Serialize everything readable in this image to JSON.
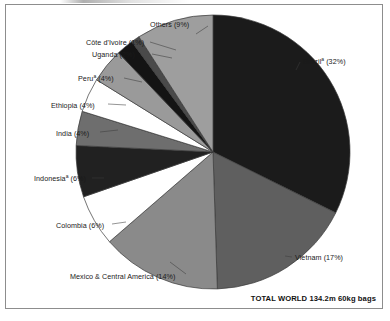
{
  "figure": {
    "frame_border_color": "#8d8d8d",
    "background": "#ffffff",
    "total_note": "TOTAL WORLD 134.2m 60kg bags"
  },
  "labels": {
    "brazil": "Brazil",
    "brazil_pct": " (32%)",
    "brazil_sup": "a",
    "vietnam": "Vietnam (17%)",
    "mexico": "Mexico & Central America (14%)",
    "colombia": "Colombia (6%)",
    "indonesia": "Indonesia",
    "indonesia_pct": " (6%)",
    "indonesia_sup": "a",
    "india": "India (4%)",
    "ethiopia": "Ethiopia (4%)",
    "peru": "Peru",
    "peru_pct": " (4%)",
    "peru_sup": "a",
    "uganda": "Uganda (2%)",
    "cotedivoire": "Côte d'Ivoire (1%)",
    "others": "Others (9%)"
  },
  "chart_data": {
    "type": "pie",
    "title": "",
    "subtitle": "",
    "xlabel": "",
    "ylabel": "",
    "units": "60kg bags",
    "total_label": "TOTAL WORLD 134.2m 60kg bags",
    "total_value": 134.2,
    "total_units": "m 60kg bags",
    "start_angle_deg": 0,
    "direction": "clockwise",
    "legend": "none-labels-outside",
    "grid": false,
    "categories": [
      "Brazil",
      "Vietnam",
      "Mexico & Central America",
      "Colombia",
      "Indonesia",
      "India",
      "Ethiopia",
      "Peru",
      "Uganda",
      "Côte d'Ivoire",
      "Others"
    ],
    "values": [
      32,
      17,
      14,
      6,
      6,
      4,
      4,
      4,
      2,
      1,
      9
    ],
    "colors": [
      "#1b1b1b",
      "#5f5f5f",
      "#8a8a8a",
      "#ffffff",
      "#212121",
      "#6e6e6e",
      "#ffffff",
      "#9a9a9a",
      "#141414",
      "#4a4a4a",
      "#9e9e9e"
    ],
    "slices": [
      {
        "name": "Brazil",
        "value": 32,
        "label": "Brazilᵃ (32%)",
        "color": "#1b1b1b"
      },
      {
        "name": "Vietnam",
        "value": 17,
        "label": "Vietnam (17%)",
        "color": "#5f5f5f"
      },
      {
        "name": "Mexico & Central America",
        "value": 14,
        "label": "Mexico & Central America (14%)",
        "color": "#8a8a8a"
      },
      {
        "name": "Colombia",
        "value": 6,
        "label": "Colombia (6%)",
        "color": "#ffffff"
      },
      {
        "name": "Indonesia",
        "value": 6,
        "label": "Indonesiaᵃ (6%)",
        "color": "#212121"
      },
      {
        "name": "India",
        "value": 4,
        "label": "India (4%)",
        "color": "#6e6e6e"
      },
      {
        "name": "Ethiopia",
        "value": 4,
        "label": "Ethiopia (4%)",
        "color": "#ffffff"
      },
      {
        "name": "Peru",
        "value": 4,
        "label": "Peruᵃ (4%)",
        "color": "#9a9a9a"
      },
      {
        "name": "Uganda",
        "value": 2,
        "label": "Uganda (2%)",
        "color": "#141414"
      },
      {
        "name": "Côte d'Ivoire",
        "value": 1,
        "label": "Côte d'Ivoire (1%)",
        "color": "#4a4a4a"
      },
      {
        "name": "Others",
        "value": 9,
        "label": "Others (9%)",
        "color": "#9e9e9e"
      }
    ]
  }
}
